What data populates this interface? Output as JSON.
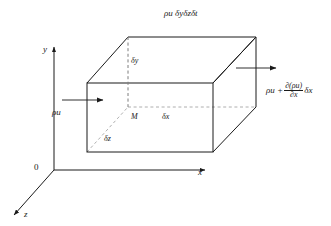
{
  "figure": {
    "title_label": "ρu δyδzδt",
    "axes": {
      "y_label": "y",
      "x_label": "x",
      "z_label": "z",
      "origin_label": "0"
    },
    "box": {
      "dy_label": "δy",
      "dx_label": "δx",
      "dz_label": "δz",
      "point_label": "M"
    },
    "flux_in": {
      "label": "ρu"
    },
    "flux_out": {
      "lead": "ρu +",
      "numerator": "∂(ρu)",
      "denominator": "∂x",
      "trailing": "δx"
    },
    "colors": {
      "line": "#1a1a1a",
      "hidden_line": "#8a8a8a",
      "background": "#ffffff"
    }
  }
}
